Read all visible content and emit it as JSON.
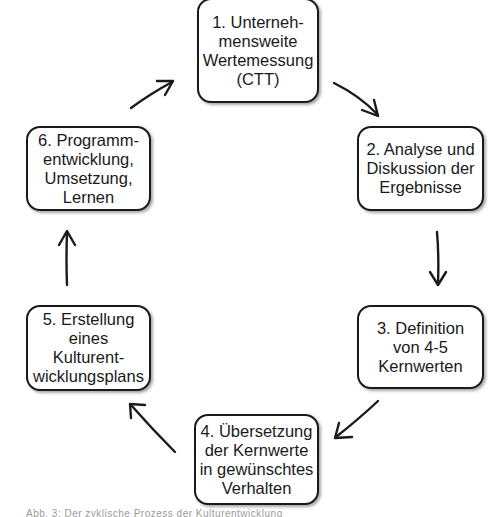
{
  "diagram": {
    "type": "cycle",
    "steps": [
      {
        "id": 1,
        "label": "1. Unterneh-\nmensweite\nWertemessung\n(CTT)"
      },
      {
        "id": 2,
        "label": "2. Analyse und\nDiskussion der\nErgebnisse"
      },
      {
        "id": 3,
        "label": "3. Definition\nvon 4-5\nKernwerten"
      },
      {
        "id": 4,
        "label": "4. Übersetzung\nder Kernwerte\nin gewünschtes\nVerhalten"
      },
      {
        "id": 5,
        "label": "5. Erstellung\neines\nKulturent-\nwicklungsplans"
      },
      {
        "id": 6,
        "label": "6. Programm-\nentwicklung,\nUmsetzung,\nLernen"
      }
    ],
    "flow": [
      {
        "from": 1,
        "to": 2
      },
      {
        "from": 2,
        "to": 3
      },
      {
        "from": 3,
        "to": 4
      },
      {
        "from": 4,
        "to": 5
      },
      {
        "from": 5,
        "to": 6
      },
      {
        "from": 6,
        "to": 1
      }
    ],
    "caption": "Abb. 3: Der zyklische Prozess der Kulturentwicklung"
  },
  "colors": {
    "stroke": "#1a1a1a",
    "background": "#ffffff",
    "caption": "#9a9a9a"
  }
}
